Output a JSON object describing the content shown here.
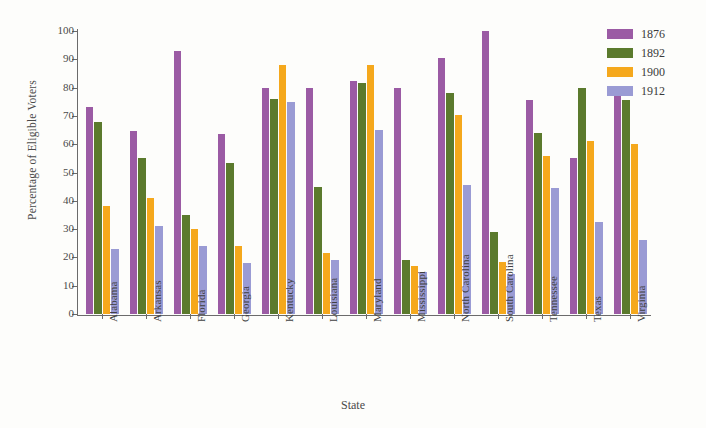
{
  "chart_data": {
    "type": "bar",
    "title": "",
    "xlabel": "State",
    "ylabel": "Percentage of Eligible Voters",
    "ylim": [
      0,
      100
    ],
    "yticks": [
      0,
      10,
      20,
      30,
      40,
      50,
      60,
      70,
      80,
      90,
      100
    ],
    "grid": false,
    "legend_position": "top-right",
    "categories": [
      "Alabama",
      "Arkansas",
      "Florida",
      "Georgia",
      "Kentucky",
      "Louisiana",
      "Maryland",
      "Mississippi",
      "North Carolina",
      "South Carolina",
      "Tennessee",
      "Texas",
      "Virginia"
    ],
    "series": [
      {
        "name": "1876",
        "color": "#9B5BA4",
        "values": [
          73,
          64.5,
          93,
          63.5,
          80,
          80,
          82.5,
          80,
          90.5,
          100,
          75.5,
          55,
          79
        ]
      },
      {
        "name": "1892",
        "color": "#5B7A2D",
        "values": [
          68,
          55,
          35,
          53.5,
          76,
          45,
          81.5,
          19,
          78,
          29,
          64,
          80,
          75.5
        ]
      },
      {
        "name": "1900",
        "color": "#F5A81C",
        "values": [
          38,
          41,
          30,
          24,
          88,
          21.5,
          88,
          17,
          70.5,
          18.5,
          56,
          61,
          60
        ]
      },
      {
        "name": "1912",
        "color": "#9A9BD4",
        "values": [
          23,
          31,
          24,
          18,
          75,
          19,
          65,
          15,
          45.5,
          14,
          44.5,
          32.5,
          26
        ]
      }
    ]
  },
  "legend": {
    "entries": [
      {
        "label": "1876",
        "color": "#9B5BA4"
      },
      {
        "label": "1892",
        "color": "#5B7A2D"
      },
      {
        "label": "1900",
        "color": "#F5A81C"
      },
      {
        "label": "1912",
        "color": "#9A9BD4"
      }
    ]
  }
}
